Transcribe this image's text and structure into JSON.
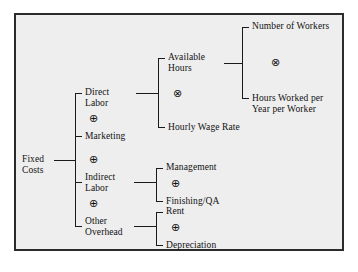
{
  "diagram": {
    "type": "tree",
    "background_color": "#eeeeee",
    "border_color": "#2b2b2b",
    "text_color": "#111111",
    "root": {
      "label_line1": "Fixed",
      "label_line2": "Costs"
    },
    "operators": {
      "plus": "⊕",
      "times": "⊗"
    },
    "level1": [
      {
        "id": "direct-labor",
        "label_line1": "Direct",
        "label_line2": "Labor"
      },
      {
        "id": "marketing",
        "label_line1": "Marketing",
        "label_line2": ""
      },
      {
        "id": "indirect-labor",
        "label_line1": "Indirect",
        "label_line2": "Labor"
      },
      {
        "id": "other-overhead",
        "label_line1": "Other",
        "label_line2": "Overhead"
      }
    ],
    "level1_operators": [
      "⊕",
      "⊕",
      "⊕"
    ],
    "direct_labor_children": [
      {
        "id": "available-hours",
        "label_line1": "Available",
        "label_line2": "Hours"
      },
      {
        "id": "hourly-wage-rate",
        "label_line1": "Hourly Wage Rate",
        "label_line2": ""
      }
    ],
    "direct_labor_operator": "⊗",
    "available_hours_children": [
      {
        "id": "number-of-workers",
        "label_line1": "Number of Workers",
        "label_line2": ""
      },
      {
        "id": "hours-worked-per-year",
        "label_line1": "Hours Worked per",
        "label_line2": "Year per Worker"
      }
    ],
    "available_hours_operator": "⊗",
    "indirect_labor_children": [
      {
        "id": "management",
        "label_line1": "Management",
        "label_line2": ""
      },
      {
        "id": "finishing-qa",
        "label_line1": "Finishing/QA",
        "label_line2": ""
      }
    ],
    "indirect_labor_operator": "⊕",
    "other_overhead_children": [
      {
        "id": "rent",
        "label_line1": "Rent",
        "label_line2": ""
      },
      {
        "id": "depreciation",
        "label_line1": "Depreciation",
        "label_line2": ""
      }
    ],
    "other_overhead_operator": "⊕"
  }
}
